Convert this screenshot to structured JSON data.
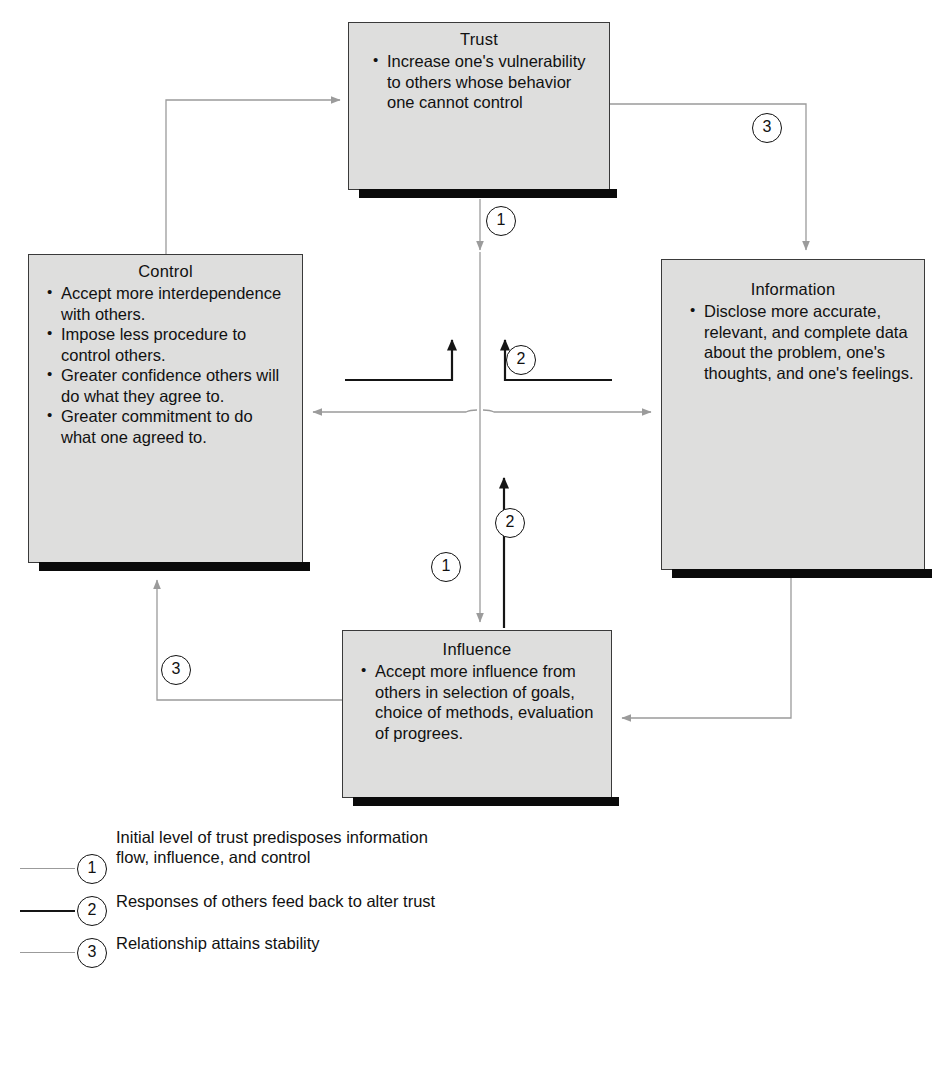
{
  "diagram": {
    "colors": {
      "box_fill": "#dededd",
      "box_border": "#3a3a3a",
      "box_shadow": "#0a0a0a",
      "wire_light": "#9b9b9b",
      "wire_dark": "#151515",
      "page_background": "#ffffff"
    },
    "nodes": [
      {
        "id": "trust",
        "title": "Trust",
        "bullets": [
          "Increase one's vulnerability to others whose behavior one cannot control"
        ]
      },
      {
        "id": "control",
        "title": "Control",
        "bullets": [
          "Accept more interdependence with others.",
          "Impose less procedure to control others.",
          "Greater confidence others will do what they agree to.",
          "Greater commitment to do what one agreed to."
        ]
      },
      {
        "id": "information",
        "title": "Information",
        "bullets": [
          "Disclose more accurate, relevant, and complete data about the problem, one's thoughts, and one's feelings."
        ]
      },
      {
        "id": "influence",
        "title": "Influence",
        "bullets": [
          "Accept more influence from others in selection of goals, choice of methods, evaluation of progrees."
        ]
      }
    ],
    "wire_badges": [
      {
        "id": "badge-3-tr",
        "label": "3"
      },
      {
        "id": "badge-1-top",
        "label": "1"
      },
      {
        "id": "badge-2-mid",
        "label": "2"
      },
      {
        "id": "badge-2-low",
        "label": "2"
      },
      {
        "id": "badge-1-low",
        "label": "1"
      },
      {
        "id": "badge-3-bl",
        "label": "3"
      }
    ]
  },
  "legend": {
    "items": [
      {
        "number": "1",
        "style": "light",
        "text": "Initial level of trust predisposes information flow, influence, and control"
      },
      {
        "number": "2",
        "style": "dark",
        "text": "Responses of others feed back to alter trust"
      },
      {
        "number": "3",
        "style": "light",
        "text": "Relationship attains stability"
      }
    ]
  }
}
